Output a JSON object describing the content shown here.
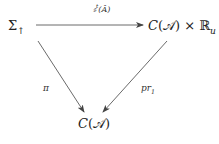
{
  "diagram": {
    "type": "commutative-diagram",
    "nodes": {
      "top_left": {
        "base": "Σ",
        "sub": "↑"
      },
      "top_right": {
        "func": "C",
        "arg": "𝒜",
        "times": "×",
        "field": "ℝ",
        "field_sub": "u"
      },
      "bottom": {
        "func": "C",
        "arg": "𝒜"
      }
    },
    "arrows": {
      "top": {
        "from": "top_left",
        "to": "top_right",
        "label_base": "𝔰",
        "label_sup": "t",
        "label_arg": "Â"
      },
      "left": {
        "from": "top_left",
        "to": "bottom",
        "label": "π"
      },
      "right": {
        "from": "top_right",
        "to": "bottom",
        "label_base": "pr",
        "label_sub": "1"
      }
    },
    "colors": {
      "line": "#444444",
      "text": "#222222"
    }
  }
}
